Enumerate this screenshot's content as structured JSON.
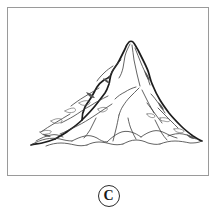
{
  "page": {
    "background_color": "#ffffff",
    "width": 217,
    "height": 211
  },
  "illustration": {
    "title": "Mountain",
    "description": "Black and white line drawing of a tall rocky mountain peak with ridges and crevices, coloring-book style",
    "frame": {
      "border_color": "#9a9a9a",
      "fill_color": "#ffffff"
    },
    "ink_color": "#1d1d1d",
    "detail_color": "#3b3b3b",
    "shading_color": "#555555"
  },
  "caption": {
    "label": "C",
    "shape": "circle-outline",
    "border_color": "#2b2b2b",
    "text_color": "#1a1a1a"
  }
}
